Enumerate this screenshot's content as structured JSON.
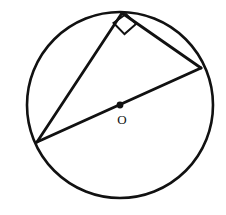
{
  "figure": {
    "background_color": "#ffffff",
    "stroke_color": "#111111",
    "width": 226,
    "height": 215
  },
  "labels": {
    "center_label": "O"
  },
  "chart_data": {
    "type": "diagram",
    "background": "#ffffff",
    "stroke_color": "#111111",
    "circle": {
      "center": [
        120,
        105
      ],
      "radius": 93,
      "stroke_width": 2.6,
      "fill": "none"
    },
    "center_point": {
      "position": [
        120,
        105
      ],
      "radius": 3.4,
      "fill": "#111111",
      "label": "O",
      "label_position": [
        122,
        121
      ]
    },
    "vertices": [
      {
        "name": "top",
        "position": [
          122,
          13
        ]
      },
      {
        "name": "left",
        "position": [
          37,
          142
        ]
      },
      {
        "name": "right",
        "position": [
          201,
          68
        ]
      }
    ],
    "segments": [
      {
        "name": "diameter",
        "from": [
          37,
          142
        ],
        "to": [
          201,
          68
        ],
        "through_center": true,
        "stroke_width": 3.0
      },
      {
        "name": "chord-top-left",
        "from": [
          122,
          13
        ],
        "to": [
          37,
          142
        ],
        "through_center": false,
        "stroke_width": 2.8
      },
      {
        "name": "chord-top-right",
        "from": [
          122,
          13
        ],
        "to": [
          201,
          68
        ],
        "through_center": false,
        "stroke_width": 2.8
      }
    ],
    "angle_markers": [
      {
        "name": "right-angle",
        "at_vertex": "top",
        "type": "square",
        "measure_degrees": 90,
        "points": [
          [
            113.6,
            23.0
          ],
          [
            124.5,
            34.1
          ],
          [
            136.0,
            23.9
          ],
          [
            126.0,
            14.0
          ]
        ],
        "stroke_width": 2.0
      }
    ],
    "xlim": [
      0,
      226
    ],
    "ylim": [
      0,
      215
    ],
    "grid": false,
    "legend": null
  }
}
